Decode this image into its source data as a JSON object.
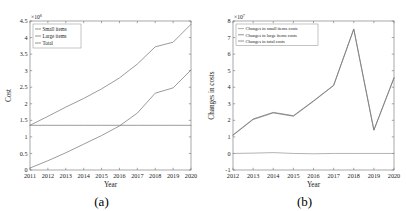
{
  "figure": {
    "panel_a_caption": "(a)",
    "panel_b_caption": "(b)"
  },
  "chart_data": [
    {
      "type": "line",
      "panel": "(a)",
      "title": "",
      "xlabel": "Year",
      "ylabel": "Cost",
      "y_multiplier": "×10",
      "y_multiplier_exp": "8",
      "x": [
        2011,
        2012,
        2013,
        2014,
        2015,
        2016,
        2017,
        2018,
        2019,
        2020
      ],
      "categories": [
        "2011",
        "2012",
        "2013",
        "2014",
        "2015",
        "2016",
        "2017",
        "2018",
        "2019",
        "2020"
      ],
      "xlim": [
        2011,
        2020
      ],
      "ylim": [
        0,
        4.5
      ],
      "yticks": [
        0,
        0.5,
        1,
        1.5,
        2,
        2.5,
        3,
        3.5,
        4,
        4.5
      ],
      "ytick_labels": [
        "0",
        "0.5",
        "1",
        "1.5",
        "2",
        "2.5",
        "3",
        "3.5",
        "4",
        "4.5"
      ],
      "grid": false,
      "legend_position": "top-left",
      "series": [
        {
          "name": "Small items",
          "color": "#7a7a7a",
          "values": [
            1.35,
            1.35,
            1.35,
            1.35,
            1.35,
            1.35,
            1.35,
            1.35,
            1.35,
            1.35
          ]
        },
        {
          "name": "Large items",
          "color": "#7a7a7a",
          "values": [
            0.06,
            0.28,
            0.52,
            0.78,
            1.04,
            1.33,
            1.72,
            2.32,
            2.48,
            3.02
          ]
        },
        {
          "name": "Total",
          "color": "#7a7a7a",
          "values": [
            1.35,
            1.62,
            1.9,
            2.16,
            2.45,
            2.78,
            3.2,
            3.72,
            3.86,
            4.4
          ]
        }
      ]
    },
    {
      "type": "line",
      "panel": "(b)",
      "title": "",
      "xlabel": "Year",
      "ylabel": "Changes in costs",
      "y_multiplier": "×10",
      "y_multiplier_exp": "7",
      "x": [
        2012,
        2013,
        2014,
        2015,
        2016,
        2017,
        2018,
        2019,
        2020
      ],
      "categories": [
        "2012",
        "2013",
        "2014",
        "2015",
        "2016",
        "2017",
        "2018",
        "2019",
        "2020"
      ],
      "xlim": [
        2012,
        2020
      ],
      "ylim": [
        -1,
        8
      ],
      "yticks": [
        -1,
        0,
        1,
        2,
        3,
        4,
        5,
        6,
        7,
        8
      ],
      "ytick_labels": [
        "-1",
        "0",
        "1",
        "2",
        "3",
        "4",
        "5",
        "6",
        "7",
        "8"
      ],
      "grid": false,
      "legend_position": "top-left",
      "series": [
        {
          "name": "Changes in small items costs",
          "color": "#9a9a9a",
          "values": [
            0.0,
            0.02,
            0.05,
            0.0,
            -0.02,
            0.0,
            0.0,
            0.0,
            0.0
          ]
        },
        {
          "name": "Changes in large items costs",
          "color": "#7a7a7a",
          "values": [
            1.1,
            2.05,
            2.45,
            2.25,
            3.15,
            4.1,
            7.5,
            1.4,
            4.55
          ]
        },
        {
          "name": "Changes in total costs",
          "color": "#7a7a7a",
          "values": [
            1.12,
            2.08,
            2.48,
            2.28,
            3.18,
            4.12,
            7.52,
            1.42,
            4.58
          ]
        }
      ]
    }
  ]
}
